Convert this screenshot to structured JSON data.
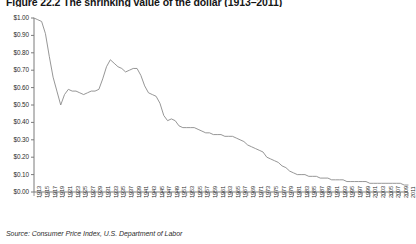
{
  "figure": {
    "title": "Figure 22.2 The shrinking value of the dollar (1913–2011)",
    "source": "Source: Consumer Price Index, U.S. Department of Labor"
  },
  "chart_data": {
    "type": "line",
    "title": "Figure 22.2 The shrinking value of the dollar (1913–2011)",
    "xlabel": "",
    "ylabel": "",
    "ylim": [
      0.0,
      1.0
    ],
    "xlim": [
      1913,
      2011
    ],
    "grid": false,
    "legend": null,
    "y_tick_labels": [
      "$1.00",
      "$0.90",
      "$0.80",
      "$0.70",
      "$0.60",
      "$0.50",
      "$0.40",
      "$0.30",
      "$0.20",
      "$0.10",
      "$0.00"
    ],
    "y_tick_values": [
      1.0,
      0.9,
      0.8,
      0.7,
      0.6,
      0.5,
      0.4,
      0.3,
      0.2,
      0.1,
      0.0
    ],
    "x_tick_labels": [
      "1913",
      "1915",
      "1917",
      "1919",
      "1921",
      "1923",
      "1925",
      "1927",
      "1929",
      "1931",
      "1933",
      "1935",
      "1937",
      "1939",
      "1941",
      "1943",
      "1945",
      "1947",
      "1949",
      "1951",
      "1953",
      "1955",
      "1957",
      "1959",
      "1961",
      "1963",
      "1965",
      "1967",
      "1969",
      "1971",
      "1973",
      "1975",
      "1977",
      "1979",
      "1981",
      "1983",
      "1985",
      "1987",
      "1989",
      "1991",
      "1993",
      "1995",
      "1997",
      "1999",
      "2001",
      "2003",
      "2005",
      "2007",
      "2009",
      "2011"
    ],
    "series": [
      {
        "name": "Purchasing power of one 1913 dollar",
        "x": [
          1913,
          1914,
          1915,
          1916,
          1917,
          1918,
          1919,
          1920,
          1921,
          1922,
          1923,
          1924,
          1925,
          1926,
          1927,
          1928,
          1929,
          1930,
          1931,
          1932,
          1933,
          1934,
          1935,
          1936,
          1937,
          1938,
          1939,
          1940,
          1941,
          1942,
          1943,
          1944,
          1945,
          1946,
          1947,
          1948,
          1949,
          1950,
          1951,
          1952,
          1953,
          1954,
          1955,
          1956,
          1957,
          1958,
          1959,
          1960,
          1961,
          1962,
          1963,
          1964,
          1965,
          1966,
          1967,
          1968,
          1969,
          1970,
          1971,
          1972,
          1973,
          1974,
          1975,
          1976,
          1977,
          1978,
          1979,
          1980,
          1981,
          1982,
          1983,
          1984,
          1985,
          1986,
          1987,
          1988,
          1989,
          1990,
          1991,
          1992,
          1993,
          1994,
          1995,
          1996,
          1997,
          1998,
          1999,
          2000,
          2001,
          2002,
          2003,
          2004,
          2005,
          2006,
          2007,
          2008,
          2009,
          2010,
          2011
        ],
        "values": [
          1.0,
          0.99,
          0.98,
          0.91,
          0.78,
          0.66,
          0.58,
          0.5,
          0.56,
          0.59,
          0.58,
          0.58,
          0.57,
          0.56,
          0.57,
          0.58,
          0.58,
          0.59,
          0.65,
          0.72,
          0.76,
          0.74,
          0.72,
          0.71,
          0.69,
          0.7,
          0.71,
          0.71,
          0.67,
          0.61,
          0.57,
          0.56,
          0.55,
          0.51,
          0.44,
          0.41,
          0.42,
          0.41,
          0.38,
          0.37,
          0.37,
          0.37,
          0.37,
          0.36,
          0.35,
          0.34,
          0.34,
          0.33,
          0.33,
          0.33,
          0.32,
          0.32,
          0.32,
          0.31,
          0.3,
          0.29,
          0.27,
          0.26,
          0.25,
          0.24,
          0.23,
          0.2,
          0.19,
          0.18,
          0.17,
          0.15,
          0.14,
          0.12,
          0.11,
          0.1,
          0.1,
          0.1,
          0.09,
          0.09,
          0.09,
          0.08,
          0.08,
          0.08,
          0.07,
          0.07,
          0.07,
          0.07,
          0.06,
          0.06,
          0.06,
          0.06,
          0.06,
          0.06,
          0.05,
          0.05,
          0.05,
          0.05,
          0.05,
          0.05,
          0.05,
          0.05,
          0.05,
          0.04,
          0.04
        ]
      }
    ],
    "line_color": "#8a8a8a",
    "axis_color": "#7b7b7b"
  }
}
